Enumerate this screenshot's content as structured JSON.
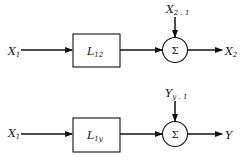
{
  "diagram": {
    "top": {
      "input_label": "X",
      "input_sub": "1",
      "block_label": "L",
      "block_sub": "12",
      "sum_symbol": "Σ",
      "disturbance_label": "X",
      "disturbance_sub": "2 . 1",
      "output_label": "X",
      "output_sub": "2"
    },
    "bottom": {
      "input_label": "X",
      "input_sub": "1",
      "block_label": "L",
      "block_sub": "1y",
      "sum_symbol": "Σ",
      "disturbance_label": "Y",
      "disturbance_sub": "y . 1",
      "output_label": "Y",
      "output_sub": ""
    }
  }
}
